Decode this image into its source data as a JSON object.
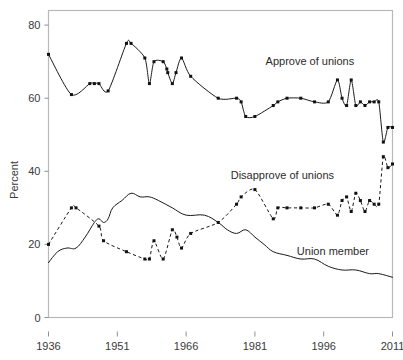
{
  "chart_data": {
    "type": "line",
    "title": "",
    "subtitle": "",
    "xlabel": "",
    "ylabel": "Percent",
    "xlim": [
      1936,
      2011
    ],
    "ylim": [
      0,
      84
    ],
    "xticks": [
      1936,
      1951,
      1966,
      1981,
      1996,
      2011
    ],
    "xtick_labels": [
      "1936",
      "1951",
      "1966",
      "1981",
      "1996",
      "2011"
    ],
    "yticks": [
      0,
      20,
      40,
      60,
      80
    ],
    "ytick_labels": [
      "0",
      "20",
      "40",
      "60",
      "80"
    ],
    "grid": false,
    "legend_position": "inline-annotations",
    "series": [
      {
        "name": "Approve of unions",
        "style": "solid",
        "marker": "square",
        "color": "#111111",
        "label_x": 1993,
        "label_y": 69,
        "points": [
          {
            "x": 1936,
            "y": 72
          },
          {
            "x": 1941,
            "y": 61
          },
          {
            "x": 1945,
            "y": 64
          },
          {
            "x": 1946,
            "y": 64
          },
          {
            "x": 1947,
            "y": 64
          },
          {
            "x": 1949,
            "y": 62
          },
          {
            "x": 1953,
            "y": 75
          },
          {
            "x": 1954,
            "y": 75
          },
          {
            "x": 1957,
            "y": 71
          },
          {
            "x": 1958,
            "y": 64
          },
          {
            "x": 1959,
            "y": 70
          },
          {
            "x": 1961,
            "y": 70
          },
          {
            "x": 1961.8,
            "y": 68
          },
          {
            "x": 1962,
            "y": 67
          },
          {
            "x": 1963,
            "y": 64
          },
          {
            "x": 1963.8,
            "y": 67
          },
          {
            "x": 1965,
            "y": 71
          },
          {
            "x": 1967,
            "y": 66
          },
          {
            "x": 1973,
            "y": 60
          },
          {
            "x": 1977,
            "y": 60
          },
          {
            "x": 1978,
            "y": 59
          },
          {
            "x": 1979,
            "y": 55
          },
          {
            "x": 1981,
            "y": 55
          },
          {
            "x": 1985,
            "y": 58
          },
          {
            "x": 1986,
            "y": 59
          },
          {
            "x": 1988,
            "y": 60
          },
          {
            "x": 1991,
            "y": 60
          },
          {
            "x": 1994,
            "y": 59
          },
          {
            "x": 1997,
            "y": 59
          },
          {
            "x": 1999,
            "y": 65
          },
          {
            "x": 2000,
            "y": 60
          },
          {
            "x": 2001,
            "y": 58
          },
          {
            "x": 2002,
            "y": 65
          },
          {
            "x": 2003,
            "y": 58
          },
          {
            "x": 2004,
            "y": 59
          },
          {
            "x": 2005,
            "y": 58
          },
          {
            "x": 2006,
            "y": 59
          },
          {
            "x": 2007,
            "y": 59
          },
          {
            "x": 2008,
            "y": 59
          },
          {
            "x": 2009,
            "y": 48
          },
          {
            "x": 2010,
            "y": 52
          },
          {
            "x": 2011,
            "y": 52
          }
        ]
      },
      {
        "name": "Disapprove of unions",
        "style": "dashed",
        "marker": "square",
        "color": "#111111",
        "label_x": 1987,
        "label_y": 38,
        "points": [
          {
            "x": 1936,
            "y": 20
          },
          {
            "x": 1941,
            "y": 30
          },
          {
            "x": 1942,
            "y": 30
          },
          {
            "x": 1947,
            "y": 25
          },
          {
            "x": 1948,
            "y": 21
          },
          {
            "x": 1953,
            "y": 18
          },
          {
            "x": 1957,
            "y": 16
          },
          {
            "x": 1958,
            "y": 16
          },
          {
            "x": 1959,
            "y": 21
          },
          {
            "x": 1961,
            "y": 16
          },
          {
            "x": 1963,
            "y": 24
          },
          {
            "x": 1964,
            "y": 22
          },
          {
            "x": 1965,
            "y": 19
          },
          {
            "x": 1967,
            "y": 23
          },
          {
            "x": 1973,
            "y": 26
          },
          {
            "x": 1977,
            "y": 31
          },
          {
            "x": 1978,
            "y": 33
          },
          {
            "x": 1981,
            "y": 35
          },
          {
            "x": 1985,
            "y": 27
          },
          {
            "x": 1986,
            "y": 30
          },
          {
            "x": 1988,
            "y": 30
          },
          {
            "x": 1991,
            "y": 30
          },
          {
            "x": 1994,
            "y": 30
          },
          {
            "x": 1997,
            "y": 31
          },
          {
            "x": 1999,
            "y": 28
          },
          {
            "x": 2000,
            "y": 32
          },
          {
            "x": 2001,
            "y": 33
          },
          {
            "x": 2002,
            "y": 29
          },
          {
            "x": 2003,
            "y": 34
          },
          {
            "x": 2004,
            "y": 32
          },
          {
            "x": 2005,
            "y": 29
          },
          {
            "x": 2006,
            "y": 32
          },
          {
            "x": 2007,
            "y": 31
          },
          {
            "x": 2008,
            "y": 31
          },
          {
            "x": 2009,
            "y": 44
          },
          {
            "x": 2010,
            "y": 41
          },
          {
            "x": 2011,
            "y": 42
          }
        ]
      },
      {
        "name": "Union member",
        "style": "solid",
        "marker": "none",
        "color": "#111111",
        "label_x": 1998,
        "label_y": 17,
        "points": [
          {
            "x": 1936,
            "y": 15
          },
          {
            "x": 1938,
            "y": 18
          },
          {
            "x": 1940,
            "y": 19
          },
          {
            "x": 1942,
            "y": 19
          },
          {
            "x": 1944,
            "y": 22
          },
          {
            "x": 1946,
            "y": 26
          },
          {
            "x": 1947,
            "y": 27
          },
          {
            "x": 1948,
            "y": 26
          },
          {
            "x": 1949,
            "y": 27
          },
          {
            "x": 1950,
            "y": 30
          },
          {
            "x": 1952,
            "y": 32
          },
          {
            "x": 1954,
            "y": 34
          },
          {
            "x": 1956,
            "y": 33
          },
          {
            "x": 1958,
            "y": 33
          },
          {
            "x": 1960,
            "y": 32
          },
          {
            "x": 1963,
            "y": 30
          },
          {
            "x": 1966,
            "y": 28
          },
          {
            "x": 1970,
            "y": 28
          },
          {
            "x": 1973,
            "y": 26
          },
          {
            "x": 1975,
            "y": 24
          },
          {
            "x": 1977,
            "y": 23
          },
          {
            "x": 1979,
            "y": 24
          },
          {
            "x": 1981,
            "y": 22
          },
          {
            "x": 1983,
            "y": 20
          },
          {
            "x": 1985,
            "y": 18
          },
          {
            "x": 1988,
            "y": 17
          },
          {
            "x": 1991,
            "y": 16
          },
          {
            "x": 1994,
            "y": 16
          },
          {
            "x": 1997,
            "y": 14
          },
          {
            "x": 2000,
            "y": 13
          },
          {
            "x": 2003,
            "y": 13
          },
          {
            "x": 2006,
            "y": 12
          },
          {
            "x": 2008,
            "y": 12
          },
          {
            "x": 2011,
            "y": 11
          }
        ]
      }
    ]
  }
}
